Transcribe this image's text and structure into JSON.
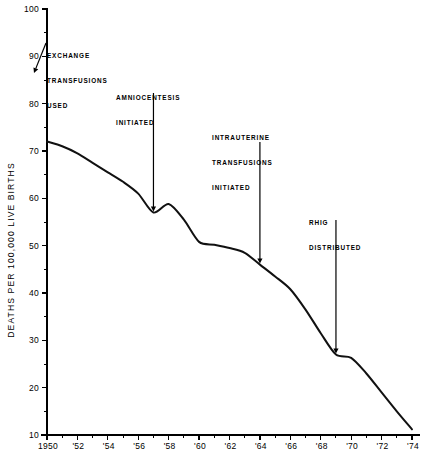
{
  "chart_data": {
    "type": "line",
    "title": "",
    "xlabel": "",
    "ylabel": "DEATHS PER 100,000 LIVE BIRTHS",
    "xlim": [
      1950,
      1974
    ],
    "ylim": [
      10,
      100
    ],
    "grid": false,
    "legend": "none",
    "x_tick_labels": [
      "1950",
      "'52",
      "'54",
      "'56",
      "'58",
      "'60",
      "'62",
      "'64",
      "'66",
      "'68",
      "'70",
      "'72",
      "'74"
    ],
    "x_tick_values": [
      1950,
      1952,
      1954,
      1956,
      1958,
      1960,
      1962,
      1964,
      1966,
      1968,
      1970,
      1972,
      1974
    ],
    "x_minor_tick_values": [
      1951,
      1953,
      1955,
      1957,
      1959,
      1961,
      1963,
      1965,
      1967,
      1969,
      1971,
      1973
    ],
    "y_tick_labels": [
      "100",
      "90",
      "80",
      "70",
      "60",
      "50",
      "40",
      "30",
      "20",
      "10"
    ],
    "y_tick_values": [
      100,
      90,
      80,
      70,
      60,
      50,
      40,
      30,
      20,
      10
    ],
    "y_minor_tick_values": [
      95,
      85,
      75,
      65,
      55,
      45,
      35,
      25,
      15
    ],
    "x": [
      1950,
      1951,
      1952,
      1953,
      1954,
      1955,
      1956,
      1957,
      1958,
      1959,
      1960,
      1961,
      1962,
      1963,
      1964,
      1965,
      1966,
      1967,
      1968,
      1969,
      1970,
      1971,
      1972,
      1973,
      1974
    ],
    "values": [
      72.0,
      71.0,
      69.5,
      67.5,
      65.5,
      63.5,
      61.0,
      57.0,
      58.8,
      55.5,
      50.8,
      50.2,
      49.5,
      48.5,
      46.0,
      43.5,
      40.8,
      36.5,
      31.5,
      27.0,
      26.3,
      23.0,
      19.0,
      15.0,
      11.2
    ],
    "series": [
      {
        "name": "Rh hemolytic disease deaths",
        "values": [
          72.0,
          71.0,
          69.5,
          67.5,
          65.5,
          63.5,
          61.0,
          57.0,
          58.8,
          55.5,
          50.8,
          50.2,
          49.5,
          48.5,
          46.0,
          43.5,
          40.8,
          36.5,
          31.5,
          27.0,
          26.3,
          23.0,
          19.0,
          15.0,
          11.2
        ]
      }
    ],
    "line_color": "#111111",
    "annotations": [
      {
        "id": "exchange-transfusions",
        "lines": [
          "EXCHANGE",
          "TRANSFUSIONS",
          "USED"
        ],
        "text": "EXCHANGE TRANSFUSIONS USED",
        "target_year": 1950,
        "target_value": 72.0,
        "arrow": "diagonal"
      },
      {
        "id": "amniocentesis",
        "lines": [
          "AMNIOCENTESIS",
          "INITIATED"
        ],
        "text": "AMNIOCENTESIS INITIATED",
        "target_year": 1957,
        "target_value": 57.0,
        "arrow": "vertical"
      },
      {
        "id": "intrauterine-transfusions",
        "lines": [
          "INTRAUTERINE",
          "TRANSFUSIONS",
          "INITIATED"
        ],
        "text": "INTRAUTERINE TRANSFUSIONS INITIATED",
        "target_year": 1964,
        "target_value": 46.0,
        "arrow": "vertical"
      },
      {
        "id": "rhig-distributed",
        "lines": [
          "RHIG",
          "DISTRIBUTED"
        ],
        "text": "RHIG DISTRIBUTED",
        "target_year": 1969,
        "target_value": 27.0,
        "arrow": "vertical"
      }
    ]
  },
  "annot_text": {
    "exchange_l1": "EXCHANGE",
    "exchange_l2": "TRANSFUSIONS",
    "exchange_l3": "USED",
    "amnio_l1": "AMNIOCENTESIS",
    "amnio_l2": "INITIATED",
    "intra_l1": "INTRAUTERINE",
    "intra_l2": "TRANSFUSIONS",
    "intra_l3": "INITIATED",
    "rhig_l1": "RHIG",
    "rhig_l2": "DISTRIBUTED"
  }
}
